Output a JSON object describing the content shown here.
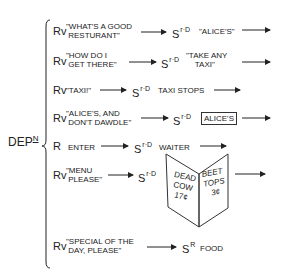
{
  "root": {
    "label": "DEP",
    "superscript": "N"
  },
  "rows": [
    {
      "response": "Rv",
      "quote": "\"WHAT'S A GOOD\n RESTURANT\"",
      "stimulus": "S",
      "stimulus_sup": "r·D",
      "result": "\"ALICE'S\"",
      "result_style": "plain",
      "arrow_after": true
    },
    {
      "response": "Rv",
      "quote": "\"HOW DO I\n GET THERE\"",
      "stimulus": "S",
      "stimulus_sup": "r·D",
      "result": "\"TAKE ANY\n    TAXI\"",
      "result_style": "plain",
      "arrow_after": true
    },
    {
      "response": "Rv",
      "quote": "\"TAXI!\"",
      "stimulus": "S",
      "stimulus_sup": "r·D",
      "result": "TAXI STOPS",
      "result_style": "plain",
      "arrow_after": true
    },
    {
      "response": "Rv",
      "quote": "\"ALICE'S, AND\n DON'T DAWDLE\"",
      "stimulus": "S",
      "stimulus_sup": "r·D",
      "result": "ALICE'S",
      "result_style": "boxed",
      "arrow_after": true
    },
    {
      "response": "R",
      "quote": "ENTER",
      "stimulus": "S",
      "stimulus_sup": "r·D",
      "result": "WAITER",
      "result_style": "plain",
      "arrow_after": true
    },
    {
      "response": "Rv",
      "quote": "\"MENU\n PLEASE\"",
      "stimulus": "S",
      "stimulus_sup": "r·D",
      "result": "menu",
      "result_style": "menu-illustration",
      "arrow_after": true
    },
    {
      "response": "Rv",
      "quote": "\"SPECIAL OF THE\n DAY, PLEASE\"",
      "stimulus": "S",
      "stimulus_sup": "R",
      "result": "FOOD",
      "result_style": "plain",
      "arrow_after": false
    }
  ],
  "menu": {
    "left_page": [
      "DEAD",
      "COW",
      "17¢"
    ],
    "right_page": [
      "BEET",
      "TOPS",
      "3¢"
    ]
  },
  "colors": {
    "ink": "#222222",
    "background": "#ffffff"
  }
}
